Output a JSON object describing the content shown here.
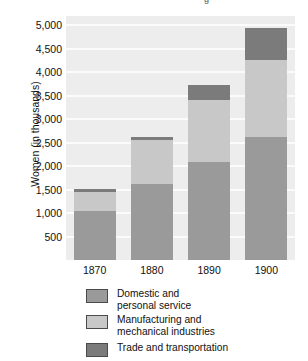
{
  "figure": {
    "clipped_title_fragment": "g",
    "background_color": "#ffffff",
    "plot_background_color": "#ededed",
    "gridline_color": "#fbfbfb"
  },
  "axes": {
    "y_axis_title": "Women (in thousands)",
    "y_tick_labels": [
      "5,000",
      "4,500",
      "4,000",
      "3,500",
      "3,000",
      "2,500",
      "2,000",
      "1,500",
      "1,000",
      "500"
    ],
    "y_tick_values": [
      5000,
      4500,
      4000,
      3500,
      3000,
      2500,
      2000,
      1500,
      1000,
      500
    ],
    "x_tick_labels": [
      "1870",
      "1880",
      "1890",
      "1900"
    ]
  },
  "legend": {
    "position": "below-plot",
    "entries": [
      {
        "label": "Domestic and\npersonal service",
        "color": "#9a9a9a"
      },
      {
        "label": "Manufacturing and\nmechanical industries",
        "color": "#c8c8c8"
      },
      {
        "label": "Trade and transportation",
        "color": "#7b7b7b"
      }
    ]
  },
  "chart_data": {
    "type": "bar",
    "subtype": "stacked-vertical",
    "title": "",
    "xlabel": "",
    "ylabel": "Women (in thousands)",
    "categories": [
      "1870",
      "1880",
      "1890",
      "1900"
    ],
    "ylim": [
      0,
      5200
    ],
    "y_major_step": 500,
    "grid": true,
    "grid_axis": "y",
    "legend_position": "below",
    "series": [
      {
        "name": "Domestic and personal service",
        "color": "#9a9a9a",
        "values": [
          1050,
          1610,
          2090,
          2620
        ]
      },
      {
        "name": "Manufacturing and mechanical industries",
        "color": "#c8c8c8",
        "values": [
          400,
          940,
          1330,
          1650
        ]
      },
      {
        "name": "Trade and transportation",
        "color": "#7b7b7b",
        "values": [
          60,
          70,
          300,
          680
        ]
      }
    ],
    "totals": [
      1510,
      2620,
      3720,
      4950
    ]
  }
}
